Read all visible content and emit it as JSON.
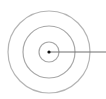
{
  "diagram": {
    "type": "concentric-circles",
    "center": {
      "x": 49,
      "y": 52
    },
    "rings": [
      {
        "name": "inner",
        "r": 10
      },
      {
        "name": "middle",
        "r": 26
      },
      {
        "name": "outer",
        "r": 41
      }
    ],
    "radius_line": {
      "x1": 49,
      "y1": 52,
      "x2": 106,
      "y2": 52
    },
    "colors": {
      "ring": "#b0b0b0",
      "line": "#707070",
      "dot": "#111111",
      "background": "#ffffff"
    }
  }
}
